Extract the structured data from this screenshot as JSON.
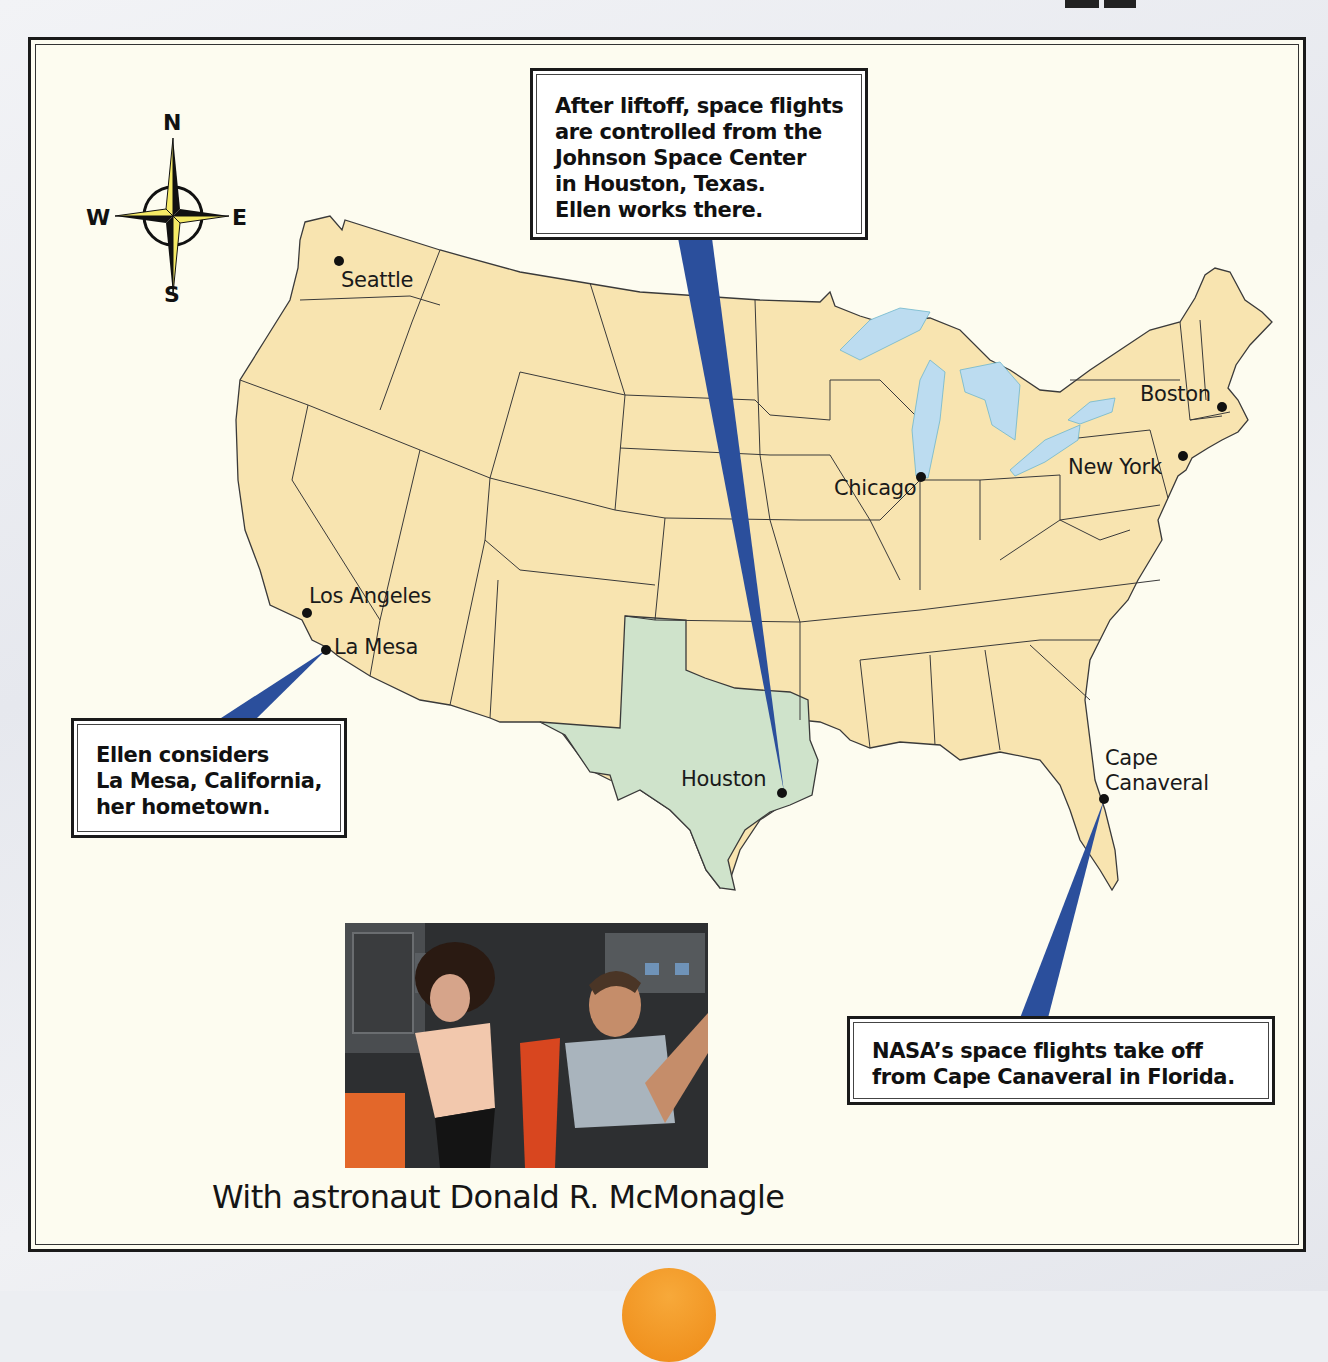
{
  "map": {
    "compass": {
      "north": "N",
      "south": "S",
      "east": "E",
      "west": "W",
      "icon": "compass-rose-icon"
    },
    "colors": {
      "land": "#f8e4b0",
      "texas": "#cfe3cb",
      "water": "#bcdcf0",
      "state_border": "#3a3a3a",
      "pointer": "#2b4f9c",
      "background": "#fdfcf0",
      "accent_disc": "#f0921e"
    },
    "cities": [
      {
        "name": "Seattle",
        "icon": "city-dot-icon"
      },
      {
        "name": "Los Angeles",
        "icon": "city-dot-icon"
      },
      {
        "name": "La Mesa",
        "icon": "city-dot-icon"
      },
      {
        "name": "Houston",
        "icon": "city-dot-icon"
      },
      {
        "name": "Chicago",
        "icon": "city-dot-icon"
      },
      {
        "name": "New York",
        "icon": "city-dot-icon"
      },
      {
        "name": "Boston",
        "icon": "city-dot-icon"
      },
      {
        "name": "Cape",
        "icon": "city-dot-icon"
      },
      {
        "name": "Canaveral",
        "icon": ""
      }
    ],
    "callouts": {
      "houston": {
        "lines": [
          "After liftoff, space flights",
          "are controlled from the",
          "Johnson Space Center",
          "in Houston, Texas.",
          "Ellen works there."
        ]
      },
      "la_mesa": {
        "lines": [
          "Ellen considers",
          "La Mesa, California,",
          "her hometown."
        ]
      },
      "cape_canaveral": {
        "lines": [
          "NASA’s space flights take off",
          "from Cape Canaveral in Florida."
        ]
      }
    }
  },
  "photo": {
    "caption": "With astronaut Donald R. McMonagle"
  }
}
